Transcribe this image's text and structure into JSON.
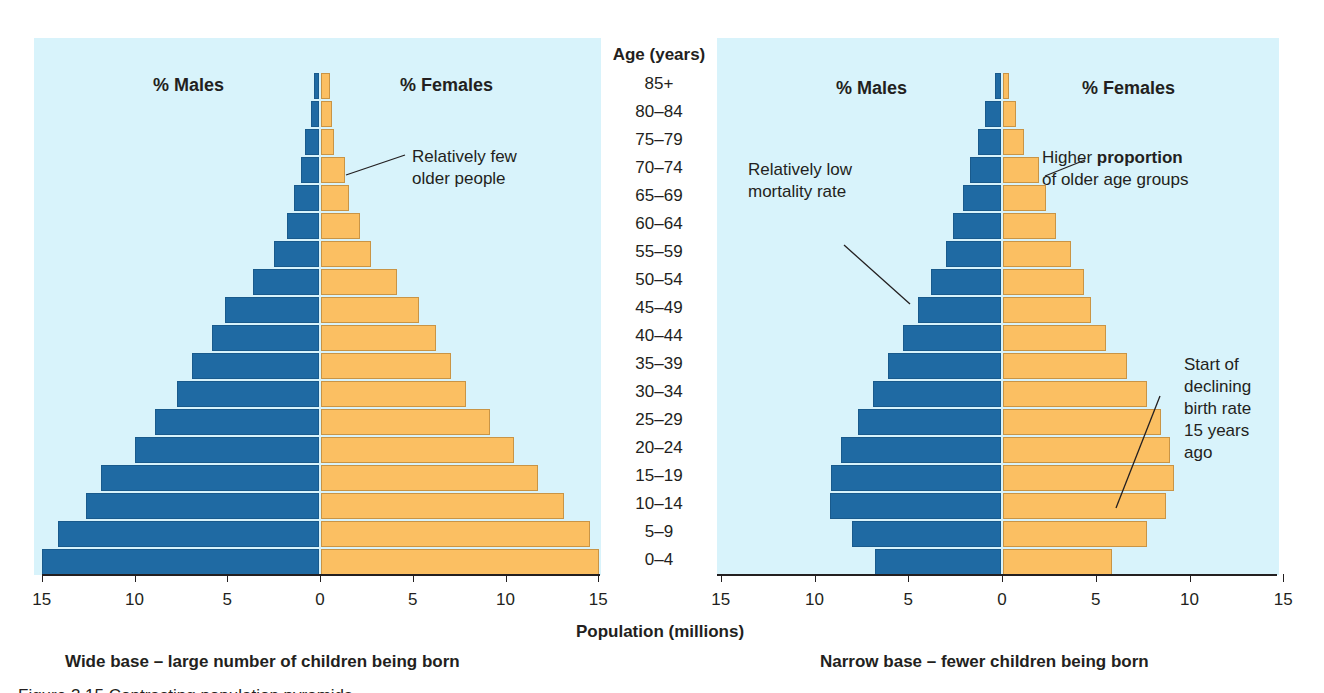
{
  "chart_data": [
    {
      "type": "bar",
      "subtype": "population-pyramid",
      "panel": "left",
      "categories": [
        "85+",
        "80–84",
        "75–79",
        "70–74",
        "65–69",
        "60–64",
        "55–59",
        "50–54",
        "45–49",
        "40–44",
        "35–39",
        "30–34",
        "25–29",
        "20–24",
        "15–19",
        "10–14",
        "5–9",
        "0–4"
      ],
      "series": [
        {
          "name": "% Males",
          "color": "#1f6aa3",
          "values": [
            0.3,
            0.5,
            0.8,
            1.0,
            1.4,
            1.8,
            2.5,
            3.6,
            5.1,
            5.8,
            6.9,
            7.7,
            8.9,
            10.0,
            11.8,
            12.6,
            14.1,
            15.0
          ]
        },
        {
          "name": "% Females",
          "color": "#fbbf62",
          "values": [
            0.5,
            0.6,
            0.7,
            1.3,
            1.5,
            2.1,
            2.7,
            4.1,
            5.3,
            6.2,
            7.0,
            7.8,
            9.1,
            10.4,
            11.7,
            13.1,
            14.5,
            15.0
          ]
        }
      ],
      "xlabel": "Population (millions)",
      "ylabel": "Age (years)",
      "xlim": [
        -15,
        15
      ],
      "xticks": [
        "15",
        "10",
        "5",
        "0",
        "5",
        "10",
        "15"
      ],
      "annotations": [
        "Relatively few older people"
      ],
      "caption": "Wide base – large number of children being born"
    },
    {
      "type": "bar",
      "subtype": "population-pyramid",
      "panel": "right",
      "categories": [
        "85+",
        "80–84",
        "75–79",
        "70–74",
        "65–69",
        "60–64",
        "55–59",
        "50–54",
        "45–49",
        "40–44",
        "35–39",
        "30–34",
        "25–29",
        "20–24",
        "15–19",
        "10–14",
        "5–9",
        "0–4"
      ],
      "series": [
        {
          "name": "% Males",
          "color": "#1f6aa3",
          "values": [
            0.4,
            0.9,
            1.3,
            1.7,
            2.1,
            2.6,
            3.0,
            3.8,
            4.5,
            5.3,
            6.1,
            6.9,
            7.7,
            8.6,
            9.1,
            9.2,
            8.0,
            6.8
          ]
        },
        {
          "name": "% Females",
          "color": "#fbbf62",
          "values": [
            0.3,
            0.7,
            1.1,
            1.9,
            2.3,
            2.8,
            3.6,
            4.3,
            4.7,
            5.5,
            6.6,
            7.7,
            8.4,
            8.9,
            9.1,
            8.7,
            7.7,
            5.8
          ]
        }
      ],
      "xlabel": "Population (millions)",
      "ylabel": "Age (years)",
      "xlim": [
        -15,
        15
      ],
      "xticks": [
        "15",
        "10",
        "5",
        "0",
        "5",
        "10",
        "15"
      ],
      "annotations": [
        "Relatively low mortality rate",
        "Higher proportion of older age groups",
        "Start of declining birth rate 15 years ago"
      ],
      "caption": "Narrow base – fewer children being born"
    }
  ],
  "age_axis": {
    "title": "Age (years)",
    "labels": [
      "85+",
      "80–84",
      "75–79",
      "70–74",
      "65–69",
      "60–64",
      "55–59",
      "50–54",
      "45–49",
      "40–44",
      "35–39",
      "30–34",
      "25–29",
      "20–24",
      "15–19",
      "10–14",
      "5–9",
      "0–4"
    ]
  },
  "left": {
    "males_label": "% Males",
    "females_label": "% Females",
    "annotation_few_older": "Relatively few\nolder people",
    "caption": "Wide base – large number of children being born"
  },
  "right": {
    "males_label": "% Males",
    "females_label": "% Females",
    "annotation_low_mortality": "Relatively low\nmortality rate",
    "annotation_higher_pre": "Higher ",
    "annotation_higher_bold": "proportion",
    "annotation_higher_post": "of older age groups",
    "annotation_declining": "Start of\ndeclining\nbirth rate\n15 years\nago",
    "caption": "Narrow base – fewer children being born"
  },
  "x_axis": {
    "title": "Population (millions)",
    "ticks": [
      "15",
      "10",
      "5",
      "0",
      "5",
      "10",
      "15"
    ]
  },
  "colors": {
    "male": "#1f6aa3",
    "female": "#fbbf62",
    "panel_bg": "#d8f3fb"
  },
  "figure_caption": "Figure 3.15 Contrasting population pyramids"
}
